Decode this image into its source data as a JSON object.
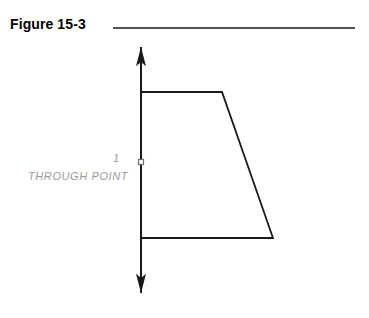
{
  "figure": {
    "title": "Figure 15-3",
    "background_color": "#ffffff",
    "line_color": "#1a1a1a",
    "label_color": "#9a9a9a",
    "title_color": "#000000",
    "header_rule": {
      "name": "header-rule",
      "x1": 113,
      "y1": 28,
      "x2": 355,
      "y2": 28,
      "width": 1.6
    },
    "axis": {
      "name": "vertical-axis",
      "x": 141,
      "y_top": 47,
      "y_bottom": 293,
      "width": 2,
      "arrow_top": true,
      "arrow_bottom": true,
      "arrow_size": 6
    },
    "marker": {
      "name": "through-point-marker",
      "shape": "square",
      "cx": 141,
      "cy": 162,
      "size": 5
    },
    "shape": {
      "name": "trapezoid-profile",
      "type": "polyline",
      "stroke_width": 1.8,
      "fill": "none",
      "points": [
        {
          "x": 141,
          "y": 92
        },
        {
          "x": 222,
          "y": 92
        },
        {
          "x": 273,
          "y": 238
        },
        {
          "x": 141,
          "y": 238
        }
      ]
    },
    "labels": {
      "index": "1",
      "through_point": "THROUGH  POINT"
    }
  }
}
